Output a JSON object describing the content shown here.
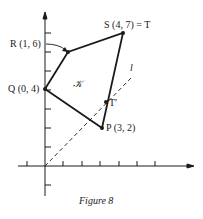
{
  "figure": {
    "caption": "Figure 8",
    "region_label": "𝒦",
    "line_label": "l",
    "points": {
      "S": {
        "label": "S (4, 7) = T",
        "x": 4,
        "y": 7
      },
      "R": {
        "label": "R (1, 6)",
        "x": 1,
        "y": 6
      },
      "Q": {
        "label": "Q (0, 4)",
        "x": 0,
        "y": 4
      },
      "P": {
        "label": "P (3, 2)",
        "x": 3,
        "y": 2
      },
      "T_prime": {
        "label": "T′"
      }
    },
    "colors": {
      "ink": "#1a1a1a",
      "background": "#ffffff"
    }
  }
}
